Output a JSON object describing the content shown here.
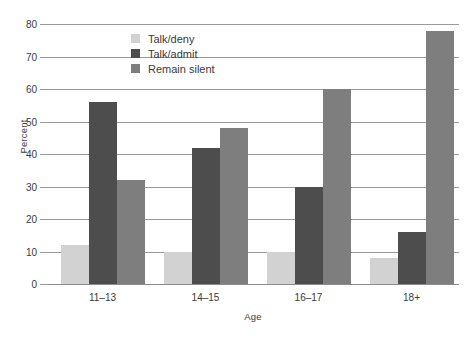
{
  "chart_data": {
    "type": "bar",
    "title": "",
    "xlabel": "Age",
    "ylabel": "Percent",
    "categories": [
      "11–13",
      "14–15",
      "16–17",
      "18+"
    ],
    "series": [
      {
        "name": "Talk/deny",
        "color": "#d2d2d2",
        "values": [
          12,
          10,
          10,
          8
        ]
      },
      {
        "name": "Talk/admit",
        "color": "#4d4d4d",
        "values": [
          56,
          42,
          30,
          16
        ]
      },
      {
        "name": "Remain silent",
        "color": "#7e7e7e",
        "values": [
          32,
          48,
          60,
          78
        ]
      }
    ],
    "ylim": [
      0,
      80
    ],
    "yticks": [
      0,
      10,
      20,
      30,
      40,
      50,
      60,
      70,
      80
    ],
    "ytick_labels": [
      "0",
      "10",
      "20",
      "30",
      "40",
      "50",
      "60",
      "70",
      "80"
    ],
    "grid": true,
    "legend_position": "top-center"
  }
}
